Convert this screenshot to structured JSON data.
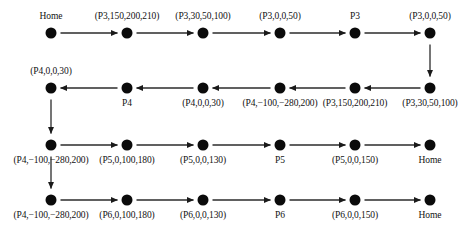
{
  "diagram": {
    "type": "sequence-flow-graph",
    "title": "",
    "node_radius_px": 5.5,
    "colors": {
      "node": "#0b0b0b",
      "edge": "#2b2b2b",
      "text": "#121212",
      "background": "#ffffff"
    },
    "rows": [
      {
        "index": 0,
        "direction": "left-to-right",
        "y": 33,
        "label_placement": "above",
        "nodes": [
          {
            "x": 51,
            "label": "Home"
          },
          {
            "x": 127,
            "label": "(P3,150,200,210)"
          },
          {
            "x": 203,
            "label": "(P3,30,50,100)"
          },
          {
            "x": 280,
            "label": "(P3,0,0,50)"
          },
          {
            "x": 355,
            "label": "P3"
          },
          {
            "x": 430,
            "label": "(P3,0,0,50)"
          }
        ]
      },
      {
        "index": 1,
        "direction": "right-to-left",
        "y": 88,
        "label_placement": "below",
        "nodes": [
          {
            "x": 51,
            "label": "(P4,0,0,30)",
            "label_placement": "above"
          },
          {
            "x": 127,
            "label": "P4"
          },
          {
            "x": 203,
            "label": "(P4,0,0,30)"
          },
          {
            "x": 280,
            "label": "(P4,−100,−280,200)"
          },
          {
            "x": 355,
            "label": "(P3,150,200,210)"
          },
          {
            "x": 430,
            "label": "(P3,30,50,100)"
          }
        ]
      },
      {
        "index": 2,
        "direction": "left-to-right",
        "y": 145,
        "label_placement": "below",
        "nodes": [
          {
            "x": 51,
            "label": "(P4,−100,−280,200)"
          },
          {
            "x": 127,
            "label": "(P5,0,100,180)"
          },
          {
            "x": 203,
            "label": "(P5,0,0,130)"
          },
          {
            "x": 280,
            "label": "P5"
          },
          {
            "x": 355,
            "label": "(P5,0,0,150)"
          },
          {
            "x": 430,
            "label": "Home"
          }
        ]
      },
      {
        "index": 3,
        "direction": "left-to-right",
        "y": 200,
        "label_placement": "below",
        "nodes": [
          {
            "x": 51,
            "label": "(P4,−100,−280,200)"
          },
          {
            "x": 127,
            "label": "(P6,0,100,180)"
          },
          {
            "x": 203,
            "label": "(P6,0,0,130)"
          },
          {
            "x": 280,
            "label": "P6"
          },
          {
            "x": 355,
            "label": "(P6,0,0,150)"
          },
          {
            "x": 430,
            "label": "Home"
          }
        ]
      }
    ],
    "vertical_connectors": [
      {
        "x": 430,
        "from_row": 0,
        "to_row": 1,
        "direction": "down"
      },
      {
        "x": 51,
        "from_row": 1,
        "to_row": 2,
        "direction": "down"
      },
      {
        "x": 51,
        "from_row": 2,
        "to_row": 3,
        "direction": "down"
      }
    ]
  }
}
